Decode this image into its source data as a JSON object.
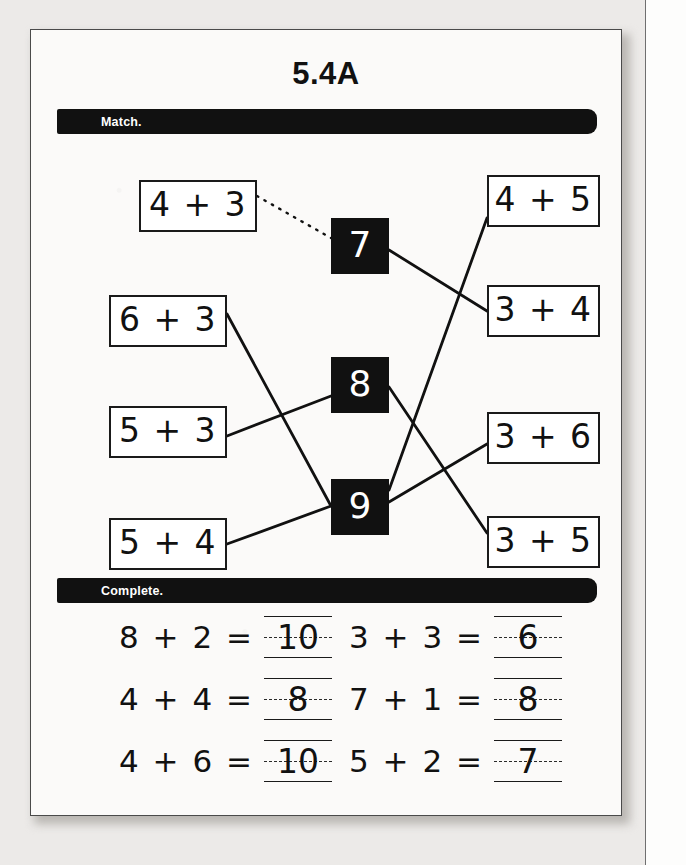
{
  "worksheet": {
    "title": "5.4A",
    "sections": [
      {
        "id": "match",
        "label": "Match."
      },
      {
        "id": "complete",
        "label": "Complete."
      }
    ]
  },
  "match": {
    "left_boxes": [
      {
        "label": "4 + 3",
        "x": 108,
        "y": 46,
        "w": 118,
        "h": 52
      },
      {
        "label": "6 + 3",
        "x": 78,
        "y": 161,
        "w": 118,
        "h": 52
      },
      {
        "label": "5 + 3",
        "x": 78,
        "y": 272,
        "w": 118,
        "h": 52
      },
      {
        "label": "5 + 4",
        "x": 78,
        "y": 384,
        "w": 118,
        "h": 52
      }
    ],
    "center_boxes": [
      {
        "label": "7",
        "x": 300,
        "y": 84,
        "w": 58,
        "h": 56
      },
      {
        "label": "8",
        "x": 300,
        "y": 223,
        "w": 58,
        "h": 56
      },
      {
        "label": "9",
        "x": 300,
        "y": 345,
        "w": 58,
        "h": 56
      }
    ],
    "right_boxes": [
      {
        "label": "4 + 5",
        "x": 456,
        "y": 41,
        "w": 113,
        "h": 52
      },
      {
        "label": "3 + 4",
        "x": 456,
        "y": 151,
        "w": 113,
        "h": 52
      },
      {
        "label": "3 + 6",
        "x": 456,
        "y": 278,
        "w": 113,
        "h": 52
      },
      {
        "label": "3 + 5",
        "x": 456,
        "y": 382,
        "w": 113,
        "h": 52
      }
    ],
    "connections": [
      {
        "from": "4 + 3",
        "to": "7",
        "style": "dotted",
        "x1": 226,
        "y1": 62,
        "x2": 300,
        "y2": 104
      },
      {
        "from": "7",
        "to": "3 + 4",
        "style": "solid",
        "x1": 358,
        "y1": 116,
        "x2": 456,
        "y2": 177
      },
      {
        "from": "6 + 3",
        "to": "9",
        "style": "solid",
        "x1": 196,
        "y1": 180,
        "x2": 300,
        "y2": 372
      },
      {
        "from": "5 + 3",
        "to": "8",
        "style": "solid",
        "x1": 196,
        "y1": 302,
        "x2": 300,
        "y2": 262
      },
      {
        "from": "5 + 4",
        "to": "9",
        "style": "solid",
        "x1": 196,
        "y1": 410,
        "x2": 300,
        "y2": 372
      },
      {
        "from": "8",
        "to": "3 + 5",
        "style": "solid",
        "x1": 358,
        "y1": 253,
        "x2": 456,
        "y2": 399
      },
      {
        "from": "9",
        "to": "4 + 5",
        "style": "solid",
        "x1": 358,
        "y1": 356,
        "x2": 456,
        "y2": 84
      },
      {
        "from": "9",
        "to": "3 + 6",
        "style": "solid",
        "x1": 358,
        "y1": 368,
        "x2": 456,
        "y2": 310
      }
    ]
  },
  "complete": {
    "problems": [
      {
        "expr": "8 + 2 =",
        "answer": "10",
        "col": 0,
        "row": 0
      },
      {
        "expr": "3 + 3 =",
        "answer": "6",
        "col": 1,
        "row": 0
      },
      {
        "expr": "4 + 4 =",
        "answer": "8",
        "col": 0,
        "row": 1
      },
      {
        "expr": "7 + 1 =",
        "answer": "8",
        "col": 1,
        "row": 1
      },
      {
        "expr": "4 + 6 =",
        "answer": "10",
        "col": 0,
        "row": 2
      },
      {
        "expr": "5 + 2 =",
        "answer": "7",
        "col": 1,
        "row": 2
      }
    ]
  },
  "colors": {
    "ink": "#111111",
    "bar": "#111111",
    "paper": "#fbfaf9",
    "bar_text": "#ffffff"
  }
}
